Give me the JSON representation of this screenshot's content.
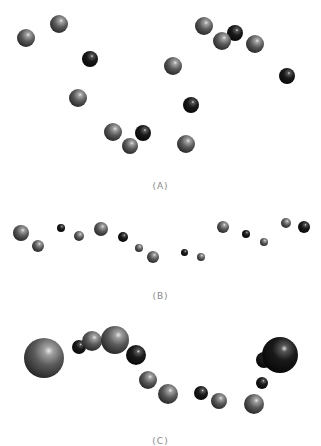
{
  "figure": {
    "panels": [
      {
        "id": "A",
        "label": "(A)",
        "spheres": [
          {
            "x": 26,
            "y": 38,
            "r": 9,
            "shade": "gray"
          },
          {
            "x": 59,
            "y": 24,
            "r": 9,
            "shade": "gray"
          },
          {
            "x": 90,
            "y": 59,
            "r": 8,
            "shade": "dark"
          },
          {
            "x": 78,
            "y": 98,
            "r": 9,
            "shade": "gray"
          },
          {
            "x": 113,
            "y": 132,
            "r": 9,
            "shade": "gray"
          },
          {
            "x": 130,
            "y": 146,
            "r": 8,
            "shade": "gray"
          },
          {
            "x": 143,
            "y": 133,
            "r": 8,
            "shade": "dark"
          },
          {
            "x": 191,
            "y": 105,
            "r": 8,
            "shade": "dark"
          },
          {
            "x": 186,
            "y": 144,
            "r": 9,
            "shade": "gray"
          },
          {
            "x": 204,
            "y": 26,
            "r": 9,
            "shade": "gray"
          },
          {
            "x": 235,
            "y": 33,
            "r": 8,
            "shade": "dark"
          },
          {
            "x": 222,
            "y": 41,
            "r": 9,
            "shade": "gray"
          },
          {
            "x": 255,
            "y": 44,
            "r": 9,
            "shade": "gray"
          },
          {
            "x": 173,
            "y": 66,
            "r": 9,
            "shade": "gray"
          },
          {
            "x": 287,
            "y": 76,
            "r": 8,
            "shade": "dark"
          }
        ]
      },
      {
        "id": "B",
        "label": "(B)",
        "spheres": [
          {
            "x": 21,
            "y": 233,
            "r": 8,
            "shade": "gray"
          },
          {
            "x": 38,
            "y": 246,
            "r": 6,
            "shade": "gray"
          },
          {
            "x": 61,
            "y": 228,
            "r": 4,
            "shade": "dark"
          },
          {
            "x": 79,
            "y": 236,
            "r": 5,
            "shade": "gray"
          },
          {
            "x": 101,
            "y": 229,
            "r": 7,
            "shade": "gray"
          },
          {
            "x": 123,
            "y": 237,
            "r": 5,
            "shade": "dark"
          },
          {
            "x": 139,
            "y": 248,
            "r": 4,
            "shade": "gray"
          },
          {
            "x": 153,
            "y": 257,
            "r": 6,
            "shade": "gray"
          },
          {
            "x": 184,
            "y": 252,
            "r": 3.5,
            "shade": "dark"
          },
          {
            "x": 201,
            "y": 257,
            "r": 4,
            "shade": "gray"
          },
          {
            "x": 223,
            "y": 227,
            "r": 6,
            "shade": "gray"
          },
          {
            "x": 246,
            "y": 234,
            "r": 4,
            "shade": "dark"
          },
          {
            "x": 264,
            "y": 242,
            "r": 4,
            "shade": "gray"
          },
          {
            "x": 286,
            "y": 223,
            "r": 5,
            "shade": "gray"
          },
          {
            "x": 304,
            "y": 227,
            "r": 6,
            "shade": "dark"
          }
        ]
      },
      {
        "id": "C",
        "label": "(C)",
        "spheres": [
          {
            "x": 44,
            "y": 358,
            "r": 20,
            "shade": "gray"
          },
          {
            "x": 79,
            "y": 347,
            "r": 7,
            "shade": "dark"
          },
          {
            "x": 92,
            "y": 341,
            "r": 10,
            "shade": "gray"
          },
          {
            "x": 115,
            "y": 340,
            "r": 14,
            "shade": "gray"
          },
          {
            "x": 136,
            "y": 355,
            "r": 10,
            "shade": "dark"
          },
          {
            "x": 148,
            "y": 380,
            "r": 9,
            "shade": "gray"
          },
          {
            "x": 168,
            "y": 394,
            "r": 10,
            "shade": "gray"
          },
          {
            "x": 201,
            "y": 393,
            "r": 7,
            "shade": "dark"
          },
          {
            "x": 219,
            "y": 401,
            "r": 8,
            "shade": "gray"
          },
          {
            "x": 254,
            "y": 404,
            "r": 10,
            "shade": "gray"
          },
          {
            "x": 262,
            "y": 383,
            "r": 6,
            "shade": "dark"
          },
          {
            "x": 264,
            "y": 360,
            "r": 8,
            "shade": "dark"
          },
          {
            "x": 280,
            "y": 355,
            "r": 18,
            "shade": "dark"
          }
        ]
      }
    ],
    "label_positions": {
      "A": 186,
      "B": 296,
      "C": 438
    }
  }
}
